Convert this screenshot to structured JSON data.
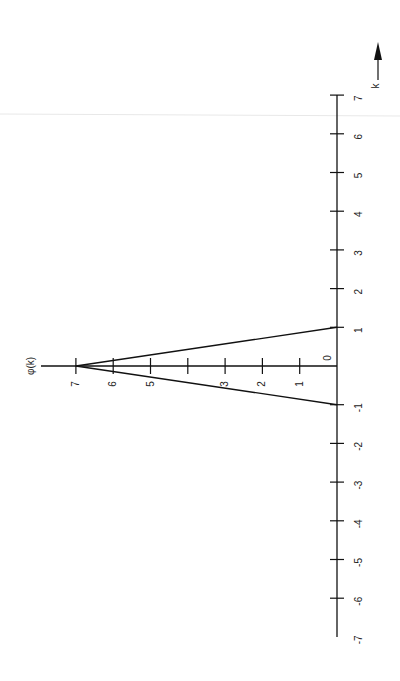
{
  "chart_data": {
    "type": "line",
    "title": "",
    "orientation": "rotated-90-ccw",
    "xlabel": "k",
    "ylabel": "φ(k)",
    "xlim": [
      -7,
      7
    ],
    "ylim": [
      0,
      7
    ],
    "x_ticks": [
      -7,
      -6,
      -5,
      -4,
      -3,
      -2,
      -1,
      0,
      1,
      2,
      3,
      4,
      5,
      6,
      7
    ],
    "x_tick_labels": [
      "-7",
      "-6",
      "-5",
      "-4",
      "-3",
      "-2",
      "-1",
      "0",
      "1",
      "2",
      "3",
      "4",
      "5",
      "6",
      "7"
    ],
    "y_ticks": [
      1,
      2,
      3,
      4,
      5,
      6,
      7
    ],
    "y_tick_labels": [
      "1",
      "2",
      "3",
      "",
      "5",
      "6",
      "7"
    ],
    "grid": false,
    "legend": null,
    "series": [
      {
        "name": "φ(k)",
        "x": [
          -1,
          0,
          1
        ],
        "y": [
          0,
          7,
          0
        ],
        "color": "#111111"
      }
    ],
    "annotations": [
      "arrow along k axis indicating positive direction"
    ]
  },
  "labels": {
    "phi_axis": "φ(k)",
    "k_axis": "k",
    "origin": "0"
  },
  "colors": {
    "ink": "#111111",
    "scan_line": "#e6e6e6",
    "background": "#ffffff"
  }
}
